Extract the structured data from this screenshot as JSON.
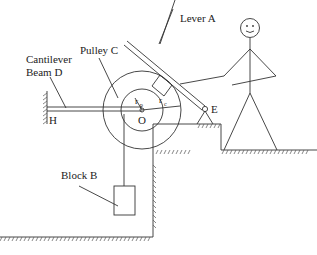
{
  "diagram": {
    "labels": {
      "lever": "Lever A",
      "pulley": "Pulley C",
      "beam_line1": "Cantilever",
      "beam_line2": "Beam D",
      "block": "Block B",
      "pivot_e": "E",
      "support_h": "H",
      "center_o": "O",
      "radius_p": "r",
      "radius_p_sub": "p",
      "radius_c": "r",
      "radius_c_sub": "c"
    },
    "colors": {
      "line": "#333333",
      "background": "#ffffff"
    }
  }
}
